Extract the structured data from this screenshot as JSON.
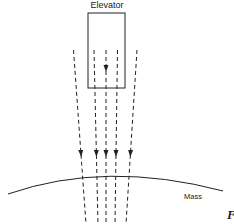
{
  "diagram": {
    "labels": {
      "elevator": "Elevator",
      "mass": "Mass",
      "figure_fragment": "F"
    },
    "colors": {
      "stroke": "#222222",
      "background": "#ffffff"
    },
    "elevator_box": {
      "x": 88,
      "y": 13,
      "width": 37,
      "height": 75
    },
    "field_lines": [
      {
        "x1": 73.5,
        "y1": 50,
        "x2": 86,
        "y2": 224,
        "arrow_y": 157
      },
      {
        "x1": 94,
        "y1": 50,
        "x2": 98,
        "y2": 224,
        "arrow_y": 157
      },
      {
        "x1": 106,
        "y1": 50,
        "x2": 106,
        "y2": 224,
        "arrow_y": 157
      },
      {
        "x1": 117.5,
        "y1": 50,
        "x2": 115,
        "y2": 224,
        "arrow_y": 157
      },
      {
        "x1": 137,
        "y1": 50,
        "x2": 126,
        "y2": 224,
        "arrow_y": 157
      }
    ],
    "center_arrow_in_elevator_y": 72,
    "mass_surface": {
      "start": [
        8,
        194
      ],
      "control": [
        106,
        160
      ],
      "end": [
        223,
        191
      ]
    }
  }
}
